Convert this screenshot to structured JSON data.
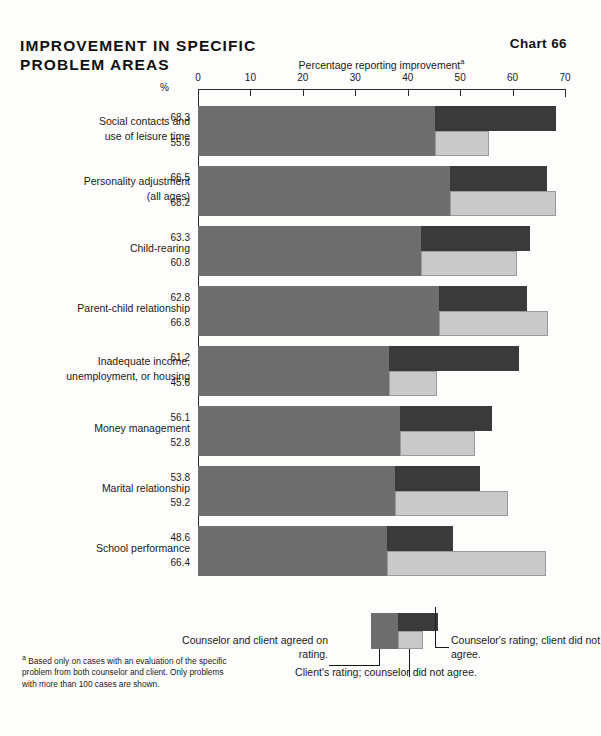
{
  "header": {
    "title": "IMPROVEMENT IN SPECIFIC PROBLEM AREAS",
    "chart_number": "Chart 66"
  },
  "axis": {
    "title": "Percentage reporting improvement",
    "title_superscript": "a",
    "pct_symbol": "%",
    "ticks": [
      "0",
      "10",
      "20",
      "30",
      "40",
      "50",
      "60",
      "70"
    ]
  },
  "legend": {
    "agreed": "Counselor and client agreed on rating.",
    "counselor": "Counselor's rating; client did not agree.",
    "client": "Client's rating; counselor did not agree."
  },
  "footnote": {
    "marker": "a",
    "text": "Based only on cases with an evaluation of the specific problem from both counselor and client. Only problems with more than 100 cases are shown."
  },
  "colors": {
    "agreed": "#6e6e6e",
    "counselor_only": "#3a3a3a",
    "client_only": "#c9c9c9",
    "background": "#fdfdfb",
    "text": "#1a1a1a"
  },
  "chart_data": {
    "type": "bar",
    "title": "IMPROVEMENT IN SPECIFIC PROBLEM AREAS",
    "xlabel": "Percentage reporting improvement",
    "ylabel": "",
    "xlim": [
      0,
      70
    ],
    "grid": false,
    "orientation": "horizontal",
    "legend_position": "bottom",
    "categories": [
      "Social contacts and use of leisure time",
      "Personality adjustment (all ages)",
      "Child-rearing",
      "Parent-child relationship",
      "Inadequate income, unemployment, or housing",
      "Money management",
      "Marital relationship",
      "School performance"
    ],
    "series": [
      {
        "name": "Counselor's rating",
        "values": [
          68.3,
          66.5,
          63.3,
          62.8,
          61.2,
          56.1,
          53.8,
          48.6
        ]
      },
      {
        "name": "Client's rating",
        "values": [
          55.6,
          68.2,
          60.8,
          66.8,
          45.6,
          52.8,
          59.2,
          66.4
        ]
      },
      {
        "name": "Agreed on rating",
        "values": [
          45.2,
          48.0,
          42.5,
          46.0,
          36.5,
          38.5,
          37.5,
          36.0
        ]
      }
    ]
  },
  "groups": [
    {
      "label_line1": "Social contacts and",
      "label_line2": "use of leisure time",
      "counselor": "68.3",
      "client": "55.6"
    },
    {
      "label_line1": "Personality adjustment",
      "label_line2": "(all ages)",
      "counselor": "66.5",
      "client": "68.2"
    },
    {
      "label_line1": "Child-rearing",
      "label_line2": "",
      "counselor": "63.3",
      "client": "60.8"
    },
    {
      "label_line1": "Parent-child relationship",
      "label_line2": "",
      "counselor": "62.8",
      "client": "66.8"
    },
    {
      "label_line1": "Inadequate income,",
      "label_line2": "unemployment, or housing",
      "counselor": "61.2",
      "client": "45.6"
    },
    {
      "label_line1": "Money management",
      "label_line2": "",
      "counselor": "56.1",
      "client": "52.8"
    },
    {
      "label_line1": "Marital relationship",
      "label_line2": "",
      "counselor": "53.8",
      "client": "59.2"
    },
    {
      "label_line1": "School performance",
      "label_line2": "",
      "counselor": "48.6",
      "client": "66.4"
    }
  ]
}
